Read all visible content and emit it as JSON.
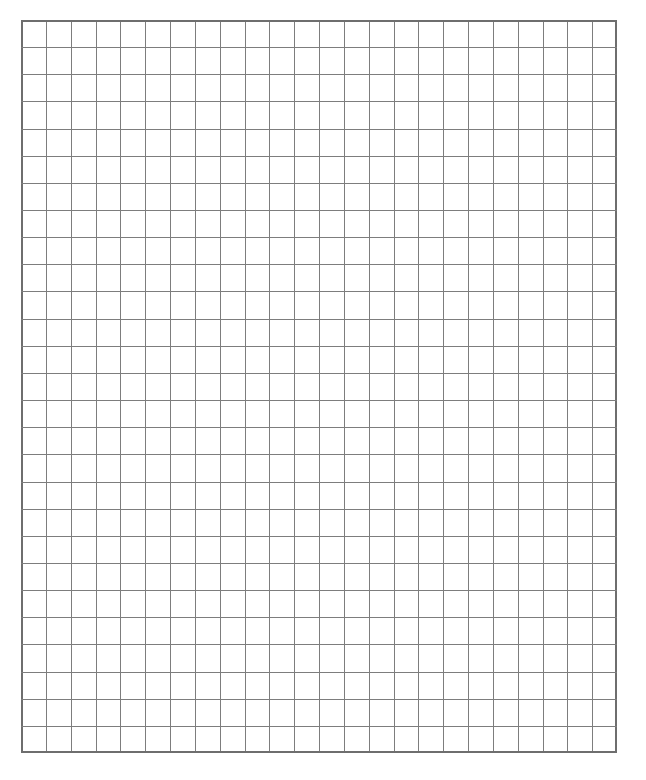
{
  "page": {
    "background_color": "#ffffff",
    "width": 646,
    "height": 780
  },
  "grid": {
    "name": "graph-paper-grid",
    "columns": 24,
    "rows": 27,
    "cell_width": 24.83,
    "cell_height": 27.15,
    "origin_x": 21,
    "origin_y": 20,
    "total_width": 596,
    "total_height": 733,
    "line_color": "#7d7d7d",
    "line_width": 1.4,
    "border_color": "#6e6e6e",
    "border_width": 1.6,
    "fill_color": "#ffffff",
    "line_style": "solid",
    "orientation": "portrait"
  },
  "margins": {
    "left": 21,
    "top": 20,
    "right": 29,
    "bottom": 27
  }
}
